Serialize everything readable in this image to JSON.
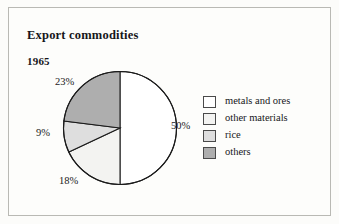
{
  "figure": {
    "title": "Export commodities",
    "year": "1965",
    "background_color": "#fcfcfa",
    "border_color": "#b9b9b4"
  },
  "chart_data": {
    "type": "pie",
    "title": "Export commodities",
    "subtitle": "1965",
    "categories": [
      "metals and ores",
      "other materials",
      "rice",
      "others"
    ],
    "values": [
      50,
      18,
      9,
      23
    ],
    "value_unit": "%",
    "data_labels": [
      "50%",
      "18%",
      "9%",
      "23%"
    ],
    "colors": [
      "#ffffff",
      "#f3f3f1",
      "#dedede",
      "#aeaeae"
    ],
    "outline_color": "#1b1b1b",
    "start_angle_deg": 0,
    "direction": "clockwise",
    "legend_position": "right",
    "grid": false
  },
  "labels": {
    "metals_and_ores": "50%",
    "other_materials": "18%",
    "rice": "9%",
    "others": "23%"
  },
  "legend": {
    "items": [
      {
        "label": "metals and ores",
        "color": "#ffffff"
      },
      {
        "label": "other materials",
        "color": "#f3f3f1"
      },
      {
        "label": "rice",
        "color": "#dedede"
      },
      {
        "label": "others",
        "color": "#aeaeae"
      }
    ]
  }
}
